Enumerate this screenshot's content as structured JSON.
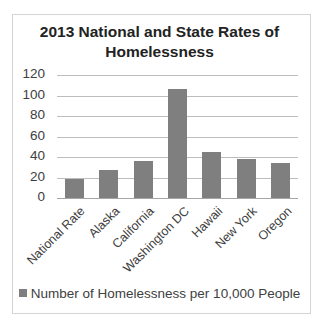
{
  "chart_data": {
    "type": "bar",
    "title": "2013 National and State Rates of Homelessness",
    "categories": [
      "National Rate",
      "Alaska",
      "California",
      "Washington DC",
      "Hawaii",
      "New York",
      "Oregon"
    ],
    "series": [
      {
        "name": "Number of Homelessness per 10,000 People",
        "values": [
          19,
          27,
          36,
          106,
          45,
          38,
          34
        ],
        "color": "#7f7f7f"
      }
    ],
    "xlabel": "",
    "ylabel": "",
    "ylim": [
      0,
      120
    ],
    "yticks": [
      0,
      20,
      40,
      60,
      80,
      100,
      120
    ],
    "grid": true,
    "legend_position": "bottom"
  },
  "title_line1": "2013 National and State Rates of",
  "title_line2": "Homelessness",
  "legend_label": "Number of Homelessness per 10,000 People"
}
